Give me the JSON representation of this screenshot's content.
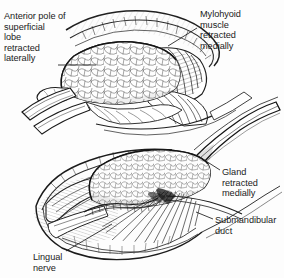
{
  "figure": {
    "background_color": "#fdfdfd",
    "ink_color": "#1b1b1b",
    "width": 284,
    "height": 278,
    "style": "pen-and-ink surgical line drawing, stippled and hatched shading"
  },
  "labels": {
    "anterior_pole": "Anterior pole of\nsuperficial\nlobe\nretracted\nlaterally",
    "mylohyoid": "Mylohyoid\nmuscle\nretracted\nmedially",
    "gland": "Gland\nretracted\nmedially",
    "submandibular_duct": "Submandibular\nduct",
    "lingual_nerve": "Lingual\nnerve"
  },
  "panels": [
    {
      "name": "upper-panel",
      "description": "Superior operative view: superficial lobe of gland retracted laterally, mylohyoid muscle retracted medially",
      "structures": [
        "superficial lobe of submandibular gland",
        "mylohyoid muscle",
        "retractor",
        "wound edge",
        "platysma flap"
      ]
    },
    {
      "name": "lower-panel",
      "description": "Deeper operative view: gland retracted medially exposing submandibular duct and lingual nerve",
      "structures": [
        "submandibular gland",
        "submandibular duct",
        "lingual nerve",
        "mylohyoid muscle",
        "hyoglossus muscle",
        "retractor"
      ]
    }
  ],
  "leaders": {
    "anterior_pole": "horizontal line from text to anterior pole of gland",
    "mylohyoid": "diagonal line down-left from text into mylohyoid muscle belly",
    "gland": "diagonal line up-left from text to gland surface",
    "submandibular_duct": "short horizontal line left from text to duct",
    "lingual_nerve": "diagonal line up-right from text to nerve"
  }
}
